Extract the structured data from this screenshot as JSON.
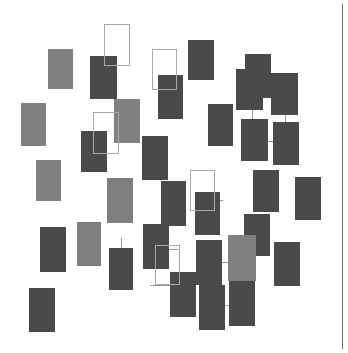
{
  "canvas": {
    "width": 348,
    "height": 353,
    "background": "#ffffff",
    "title": "Rectangle Scatter Canvas"
  },
  "palette": {
    "fill_dark": "#4a4a4a",
    "fill_light": "#808080",
    "outline_stroke": "#a8a8a8",
    "connector_stroke": "#9a9a9a",
    "rule_stroke": "#6f6f6f",
    "background": "#ffffff"
  },
  "right_rule": {
    "x": 342,
    "y": 4,
    "width": 1,
    "height": 345
  },
  "shapes": [
    {
      "id": "r01",
      "style": "filled",
      "tone": "light",
      "x": 48,
      "y": 49,
      "w": 25,
      "h": 40
    },
    {
      "id": "r02",
      "style": "filled",
      "tone": "dark",
      "x": 90,
      "y": 56,
      "w": 27,
      "h": 43
    },
    {
      "id": "r03",
      "style": "filled",
      "tone": "dark",
      "x": 188,
      "y": 40,
      "w": 26,
      "h": 40
    },
    {
      "id": "r04",
      "style": "filled",
      "tone": "dark",
      "x": 158,
      "y": 75,
      "w": 25,
      "h": 44
    },
    {
      "id": "r05",
      "style": "filled",
      "tone": "light",
      "x": 21,
      "y": 103,
      "w": 25,
      "h": 43
    },
    {
      "id": "r06",
      "style": "filled",
      "tone": "light",
      "x": 114,
      "y": 99,
      "w": 26,
      "h": 44
    },
    {
      "id": "r07",
      "style": "filled",
      "tone": "dark",
      "x": 81,
      "y": 131,
      "w": 26,
      "h": 41
    },
    {
      "id": "r08",
      "style": "filled",
      "tone": "light",
      "x": 36,
      "y": 160,
      "w": 25,
      "h": 41
    },
    {
      "id": "r09",
      "style": "filled",
      "tone": "dark",
      "x": 142,
      "y": 136,
      "w": 26,
      "h": 44
    },
    {
      "id": "r10",
      "style": "filled",
      "tone": "dark",
      "x": 245,
      "y": 54,
      "w": 26,
      "h": 44
    },
    {
      "id": "r11",
      "style": "filled",
      "tone": "dark",
      "x": 236,
      "y": 69,
      "w": 27,
      "h": 41
    },
    {
      "id": "r12",
      "style": "filled",
      "tone": "dark",
      "x": 271,
      "y": 73,
      "w": 27,
      "h": 42
    },
    {
      "id": "r13",
      "style": "filled",
      "tone": "dark",
      "x": 208,
      "y": 104,
      "w": 25,
      "h": 42
    },
    {
      "id": "r14",
      "style": "filled",
      "tone": "dark",
      "x": 241,
      "y": 119,
      "w": 27,
      "h": 42
    },
    {
      "id": "r15",
      "style": "filled",
      "tone": "dark",
      "x": 273,
      "y": 122,
      "w": 26,
      "h": 43
    },
    {
      "id": "r16",
      "style": "filled",
      "tone": "light",
      "x": 107,
      "y": 178,
      "w": 26,
      "h": 45
    },
    {
      "id": "r17",
      "style": "filled",
      "tone": "dark",
      "x": 161,
      "y": 181,
      "w": 25,
      "h": 45
    },
    {
      "id": "r18",
      "style": "filled",
      "tone": "dark",
      "x": 195,
      "y": 192,
      "w": 25,
      "h": 43
    },
    {
      "id": "r19",
      "style": "filled",
      "tone": "dark",
      "x": 253,
      "y": 170,
      "w": 26,
      "h": 42
    },
    {
      "id": "r20",
      "style": "filled",
      "tone": "dark",
      "x": 295,
      "y": 177,
      "w": 26,
      "h": 43
    },
    {
      "id": "r21",
      "style": "filled",
      "tone": "dark",
      "x": 40,
      "y": 227,
      "w": 26,
      "h": 45
    },
    {
      "id": "r22",
      "style": "filled",
      "tone": "light",
      "x": 77,
      "y": 222,
      "w": 24,
      "h": 44
    },
    {
      "id": "r23",
      "style": "filled",
      "tone": "dark",
      "x": 109,
      "y": 248,
      "w": 24,
      "h": 42
    },
    {
      "id": "r24",
      "style": "filled",
      "tone": "dark",
      "x": 143,
      "y": 224,
      "w": 26,
      "h": 45
    },
    {
      "id": "r25",
      "style": "filled",
      "tone": "dark",
      "x": 170,
      "y": 272,
      "w": 26,
      "h": 45
    },
    {
      "id": "r26",
      "style": "filled",
      "tone": "dark",
      "x": 196,
      "y": 240,
      "w": 26,
      "h": 45
    },
    {
      "id": "r27",
      "style": "filled",
      "tone": "dark",
      "x": 244,
      "y": 214,
      "w": 26,
      "h": 42
    },
    {
      "id": "r28",
      "style": "filled",
      "tone": "light",
      "x": 228,
      "y": 235,
      "w": 28,
      "h": 46
    },
    {
      "id": "r29",
      "style": "filled",
      "tone": "dark",
      "x": 274,
      "y": 242,
      "w": 26,
      "h": 44
    },
    {
      "id": "r30",
      "style": "filled",
      "tone": "dark",
      "x": 199,
      "y": 285,
      "w": 26,
      "h": 45
    },
    {
      "id": "r31",
      "style": "filled",
      "tone": "dark",
      "x": 229,
      "y": 281,
      "w": 26,
      "h": 45
    },
    {
      "id": "r32",
      "style": "filled",
      "tone": "dark",
      "x": 29,
      "y": 288,
      "w": 26,
      "h": 44
    },
    {
      "id": "r33",
      "style": "outlined",
      "tone": "outline",
      "x": 104,
      "y": 24,
      "w": 26,
      "h": 42
    },
    {
      "id": "r34",
      "style": "outlined",
      "tone": "outline",
      "x": 152,
      "y": 49,
      "w": 25,
      "h": 41
    },
    {
      "id": "r35",
      "style": "outlined",
      "tone": "outline",
      "x": 93,
      "y": 112,
      "w": 26,
      "h": 42
    },
    {
      "id": "r36",
      "style": "outlined",
      "tone": "outline",
      "x": 190,
      "y": 170,
      "w": 25,
      "h": 41
    },
    {
      "id": "r37",
      "style": "outlined",
      "tone": "outline",
      "x": 155,
      "y": 245,
      "w": 25,
      "h": 40
    }
  ],
  "connectors": [
    {
      "id": "c01",
      "orientation": "horizontal",
      "x": 263,
      "y": 96,
      "w": 9,
      "h": 1
    },
    {
      "id": "c02",
      "orientation": "vertical",
      "x": 252,
      "y": 110,
      "w": 1,
      "h": 10
    },
    {
      "id": "c03",
      "orientation": "vertical",
      "x": 285,
      "y": 115,
      "w": 1,
      "h": 8
    },
    {
      "id": "c04",
      "orientation": "horizontal",
      "x": 268,
      "y": 141,
      "w": 6,
      "h": 1
    },
    {
      "id": "c05",
      "orientation": "horizontal",
      "x": 215,
      "y": 200,
      "w": 8,
      "h": 1
    },
    {
      "id": "c06",
      "orientation": "horizontal",
      "x": 222,
      "y": 262,
      "w": 7,
      "h": 1
    },
    {
      "id": "c07",
      "orientation": "vertical",
      "x": 243,
      "y": 256,
      "w": 1,
      "h": 26
    },
    {
      "id": "c08",
      "orientation": "vertical",
      "x": 212,
      "y": 281,
      "w": 1,
      "h": 5
    },
    {
      "id": "c09",
      "orientation": "horizontal",
      "x": 222,
      "y": 305,
      "w": 8,
      "h": 1
    },
    {
      "id": "c10",
      "orientation": "vertical",
      "x": 121,
      "y": 238,
      "w": 1,
      "h": 11
    },
    {
      "id": "c11",
      "orientation": "horizontal",
      "x": 168,
      "y": 249,
      "w": 10,
      "h": 1
    },
    {
      "id": "c12",
      "orientation": "horizontal",
      "x": 150,
      "y": 285,
      "w": 21,
      "h": 1
    }
  ]
}
